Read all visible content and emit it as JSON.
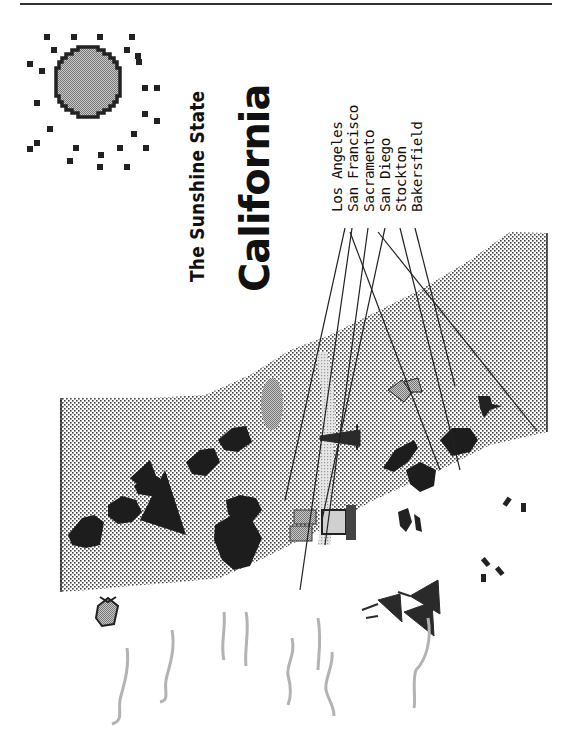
{
  "page": {
    "subtitle": "The Sunshine State",
    "title": "California"
  },
  "legend": {
    "cities": [
      {
        "name": "Los Angeles"
      },
      {
        "name": "San Francisco"
      },
      {
        "name": "Sacramento"
      },
      {
        "name": "San Diego"
      },
      {
        "name": "Stockton"
      },
      {
        "name": "Bakersfield"
      }
    ]
  },
  "illustration": {
    "icons": [
      "sun-icon",
      "mountain-icon",
      "lake-icon",
      "oil-derrick-icon",
      "grapes-icon",
      "airplane-icon",
      "palm-tree-icon",
      "buildings-icon",
      "computer-icon",
      "fish-icon",
      "ship-icon",
      "footprints-icon",
      "wave-icon"
    ],
    "colors": {
      "ink": "#1a1a1a",
      "land_dots": "#555555",
      "gray_fill": "#9a9a9a",
      "wave": "#b0b0b0",
      "paper": "#ffffff"
    }
  }
}
